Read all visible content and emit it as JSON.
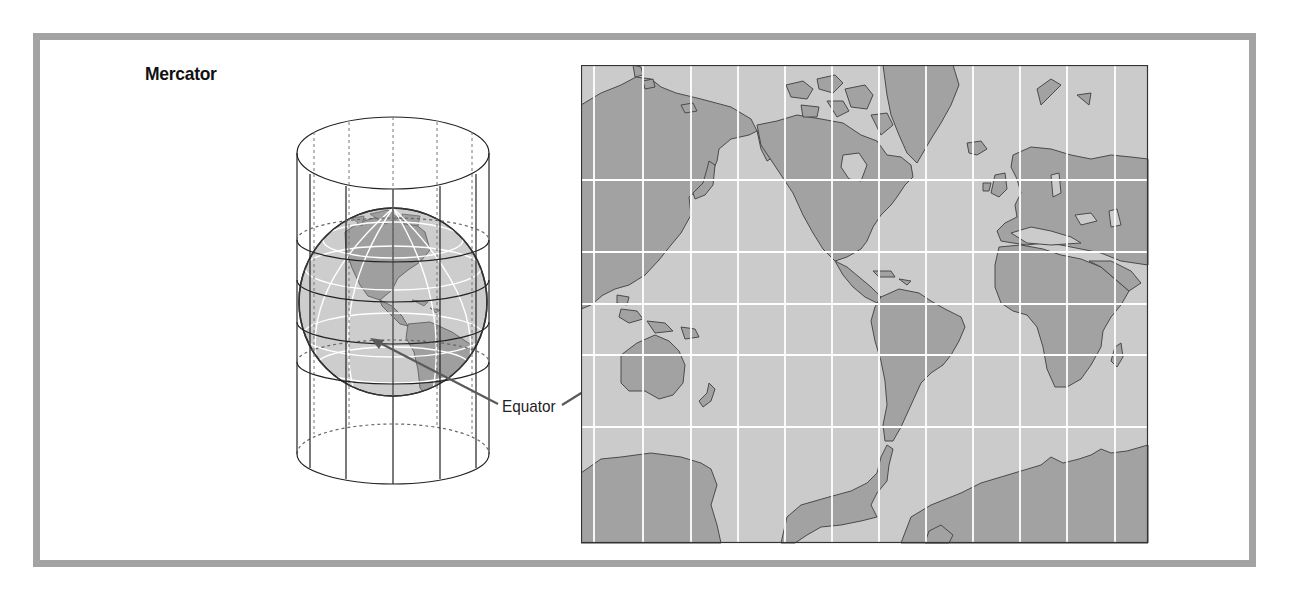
{
  "figure": {
    "title": "Mercator",
    "annotation": "Equator",
    "projection_type": "cylindrical",
    "components": {
      "cylinder_diagram": "globe inside tangent cylinder with projected meridians",
      "map": "world map on Mercator projection with white graticule"
    },
    "colors": {
      "frame": "#a3a3a3",
      "ocean": "#cbcbcb",
      "land": "#a2a2a2",
      "coast": "#555555",
      "graticule": "#ffffff",
      "arrow": "#5a5a5a",
      "outline": "#222222"
    },
    "map_graticule": {
      "meridian_x": [
        13,
        62,
        110,
        157,
        204,
        251,
        298,
        345,
        392,
        439,
        486,
        534
      ],
      "parallel_y": [
        115,
        187,
        239,
        290,
        362
      ],
      "equator_y": 239
    }
  }
}
